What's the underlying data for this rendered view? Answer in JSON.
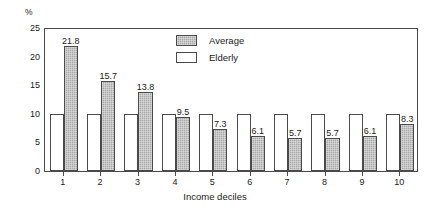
{
  "chart_data": {
    "type": "bar",
    "title": "",
    "subtitle": "",
    "xlabel": "Income deciles",
    "ylabel": "%",
    "ylim": [
      0,
      25
    ],
    "yticks": [
      0,
      5,
      10,
      15,
      20,
      25
    ],
    "ytick_labels": [
      "0",
      "5",
      "10",
      "15",
      "20",
      "25"
    ],
    "grid": false,
    "legend_position": "top-center",
    "categories": [
      "1",
      "2",
      "3",
      "4",
      "5",
      "6",
      "7",
      "8",
      "9",
      "10"
    ],
    "series": [
      {
        "name": "Elderly",
        "fill": "white",
        "color": "#ffffff",
        "values": [
          10,
          10,
          10,
          10,
          10,
          10,
          10,
          10,
          10,
          10
        ],
        "labels_shown": false,
        "labels": [
          "",
          "",
          "",
          "",
          "",
          "",
          "",
          "",
          "",
          ""
        ]
      },
      {
        "name": "Average",
        "fill": "hatched-grey",
        "color": "#a8a8a8",
        "values": [
          21.8,
          15.7,
          13.8,
          9.5,
          7.3,
          6.1,
          5.7,
          5.7,
          6.1,
          8.3
        ],
        "labels_shown": true,
        "labels": [
          "21.8",
          "15.7",
          "13.8",
          "9.5",
          "7.3",
          "6.1",
          "5.7",
          "5.7",
          "6.1",
          "8.3"
        ]
      }
    ]
  },
  "legend": {
    "items": [
      {
        "label": "Average",
        "swatch": "average"
      },
      {
        "label": "Elderly",
        "swatch": "elderly"
      }
    ]
  },
  "axes": {
    "y_unit_label": "%",
    "x_title": "Income deciles"
  },
  "colors": {
    "average_fill": "#a8a8a8",
    "elderly_fill": "#ffffff",
    "axis": "#4a4a4a",
    "text": "#1a1a1a",
    "background": "#ffffff"
  }
}
